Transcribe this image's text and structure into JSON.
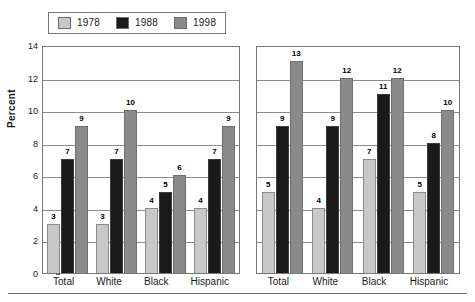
{
  "legend": {
    "position": "top-left",
    "entries": [
      {
        "label": "1978",
        "color": "#c8c8c8"
      },
      {
        "label": "1988",
        "color": "#1a1a1a"
      },
      {
        "label": "1998",
        "color": "#8a8a8a"
      }
    ]
  },
  "axis": {
    "ylabel": "Percent",
    "yticks": [
      "0",
      "2",
      "4",
      "6",
      "8",
      "10",
      "12",
      "14"
    ]
  },
  "chart_data": [
    {
      "type": "bar",
      "title": "",
      "subtitle": "",
      "xlabel": "",
      "ylabel": "Percent",
      "ylim": [
        0,
        14
      ],
      "ytick_step": 2,
      "grid": true,
      "legend_position": "top-left",
      "categories": [
        "Total",
        "White",
        "Black",
        "Hispanic"
      ],
      "series": [
        {
          "name": "1978",
          "color": "#c8c8c8",
          "values": [
            3,
            3,
            4,
            4
          ]
        },
        {
          "name": "1988",
          "color": "#1a1a1a",
          "values": [
            7,
            7,
            5,
            7
          ]
        },
        {
          "name": "1998",
          "color": "#8a8a8a",
          "values": [
            9,
            10,
            6,
            9
          ]
        }
      ]
    },
    {
      "type": "bar",
      "title": "",
      "subtitle": "",
      "xlabel": "",
      "ylabel": "",
      "ylim": [
        0,
        14
      ],
      "ytick_step": 2,
      "grid": true,
      "legend_position": "top-left",
      "categories": [
        "Total",
        "White",
        "Black",
        "Hispanic"
      ],
      "series": [
        {
          "name": "1978",
          "color": "#c8c8c8",
          "values": [
            5,
            4,
            7,
            5
          ]
        },
        {
          "name": "1988",
          "color": "#1a1a1a",
          "values": [
            9,
            9,
            11,
            8
          ]
        },
        {
          "name": "1998",
          "color": "#8a8a8a",
          "values": [
            13,
            12,
            12,
            10
          ]
        }
      ]
    }
  ]
}
